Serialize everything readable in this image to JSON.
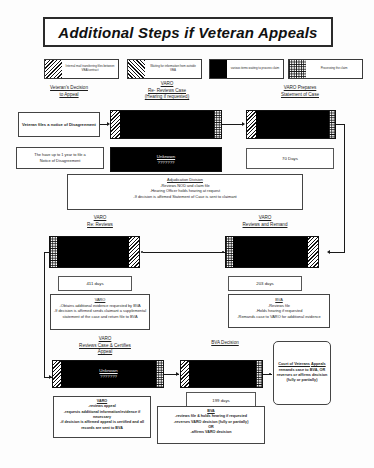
{
  "document": {
    "title": "Additional Steps if Veteran Appeals"
  },
  "legend": {
    "items": [
      {
        "pattern": "diagonal-hatch",
        "label": "Internal mail transferring files between VBA/contract"
      },
      {
        "pattern": "diagonal-hatch",
        "label": "Waiting for information from outside VBA"
      },
      {
        "pattern": "solid-black",
        "label": "various items waiting to process claim"
      },
      {
        "pattern": "checkerboard",
        "label": "Processing the claim"
      }
    ]
  },
  "stages": {
    "veterans_decision": "Veteran's Decision\nto Appeal",
    "veterans_decision_line1": "Veteran's Decision",
    "veterans_decision_line2": "to Appeal",
    "varo_re_reviews_line1": "VARO",
    "varo_re_reviews_line2": "Re- Reviews Case",
    "varo_re_reviews_line3": "(Hearing if requested)",
    "varo_prepares_line1": "VARO Prepares",
    "varo_prepares_line2": "Statement of Case",
    "varo_re_reviews2_line1": "VARO",
    "varo_re_reviews2_line2": "Re: Reviews",
    "varo_reviews_remand_line1": "VARO",
    "varo_reviews_remand_line2": "Reviews and Remand",
    "varo_certifies_line1": "VARO",
    "varo_certifies_line2": "Reviews Case & Certifies",
    "varo_certifies_line3": "Appeal",
    "bva_decision": "BVA Decision"
  },
  "boxes": {
    "notice_of_disagreement": "Veteran files a notice of Disagreement",
    "one_year_note_line1": "The have up to 1 year to file a",
    "one_year_note_line2": "Notice of Disagreement",
    "unknown_label": "Unknown",
    "unknown_marks": "???????",
    "adjudication": {
      "title": "Adjudication Division",
      "lines": [
        "-Reviews NOD and claim file",
        "-Hearing Officer holds hearing at request",
        "-If decision is affirmed Statement of Case is sent to claimant"
      ]
    },
    "varo_obtains": {
      "title": "VARO",
      "lines": [
        "-Obtains additional evidence requested by BVA",
        "-If decision is affirmed sends claimant a supplemental statement of the case and return file to BVA"
      ]
    },
    "bva_reviews": {
      "title": "BVA",
      "lines": [
        "-Reviews file",
        "-Holds hearing if requested",
        "-Remands case to VARO for additional evidence"
      ]
    },
    "varo_reviews_appeal": {
      "title": "VARO",
      "lines": [
        "-reviews appeal",
        "-requests additional information/evidence if necessary",
        "-if decision is affirmed appeal is certified and all records are sent to BVA"
      ]
    },
    "bva_final": {
      "title": "BVA",
      "lines": [
        "-reviews file & holds hearing if requested",
        "-reverses VARO decision (fully or partially)",
        "OR",
        "-affirms VARO decision"
      ]
    },
    "court_of_veterans_appeals": {
      "title_line1": "Court of Veterans",
      "title_line2": "Appeals",
      "lines": [
        "remands case to",
        "BVA, OR",
        "reverses or",
        "affirms decision",
        "(fully or partially)"
      ]
    }
  },
  "durations": {
    "statement_of_case": "70 Days",
    "varo_re_reviews": "411 days",
    "varo_reviews_remand": "203 days",
    "bva_decision": "199 days"
  },
  "colors": {
    "ink": "#1a1a1a",
    "paper": "#fdfdfd",
    "bar_fill": "#000000"
  }
}
